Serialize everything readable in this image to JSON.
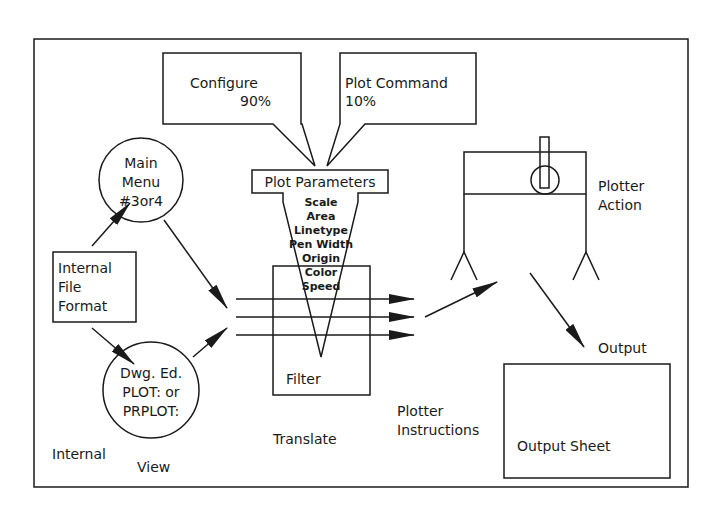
{
  "diagram": {
    "callouts": {
      "configure": {
        "label": "Configure",
        "value": "90%"
      },
      "plot_command": {
        "label": "Plot Command",
        "value": "10%"
      }
    },
    "plot_parameters": {
      "title": "Plot Parameters",
      "items": [
        "Scale",
        "Area",
        "Linetype",
        "Pen Width",
        "Origin",
        "Color",
        "Speed"
      ]
    },
    "nodes": {
      "main_menu": {
        "lines": [
          "Main",
          "Menu",
          "#3or4"
        ]
      },
      "internal_file_format": {
        "lines": [
          "Internal",
          "File",
          "Format"
        ]
      },
      "drawing_editor": {
        "lines": [
          "Dwg. Ed.",
          "PLOT: or",
          "PRPLOT:"
        ]
      },
      "filter": {
        "label": "Filter"
      },
      "output_sheet": {
        "label": "Output Sheet"
      }
    },
    "labels": {
      "internal": "Internal",
      "view": "View",
      "translate": "Translate",
      "plotter_instructions": [
        "Plotter",
        "Instructions"
      ],
      "plotter_action": [
        "Plotter",
        "Action"
      ],
      "output": "Output"
    }
  }
}
